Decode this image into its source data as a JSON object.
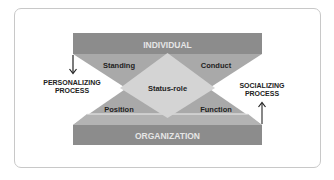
{
  "diagram": {
    "top_bar": {
      "label": "INDIVIDUAL"
    },
    "bottom_bar": {
      "label": "ORGANIZATION"
    },
    "center": {
      "label": "Status-role"
    },
    "quadrants": {
      "top_left": "Standing",
      "top_right": "Conduct",
      "bottom_left": "Position",
      "bottom_right": "Function"
    },
    "left_process": {
      "line1": "PERSONALIZING",
      "line2": "PROCESS",
      "arrow": "down"
    },
    "right_process": {
      "line1": "SOCIALIZING",
      "line2": "PROCESS",
      "arrow": "up"
    }
  },
  "colors": {
    "bar": "#8c8c8c",
    "triangle": "#a9a9a9",
    "diamond": "#d4d4d4",
    "bar_text": "#e6e6e6",
    "text": "#222222",
    "frame": "#c8c8c8",
    "lower_band": "#b8b8b8"
  }
}
